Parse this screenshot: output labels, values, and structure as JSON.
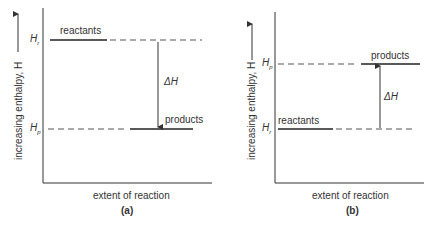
{
  "panels": [
    {
      "id": "a",
      "caption": "(a)",
      "xlabel": "extent of reaction",
      "ylabel": "increasing enthalpy, H",
      "top_level": {
        "symbol": "H",
        "sub": "r",
        "label": "reactants"
      },
      "bottom_level": {
        "symbol": "H",
        "sub": "p",
        "label": "products"
      },
      "delta": "ΔH",
      "arrow_direction": "down"
    },
    {
      "id": "b",
      "caption": "(b)",
      "xlabel": "extent of reaction",
      "ylabel": "increasing enthalpy, H",
      "top_level": {
        "symbol": "H",
        "sub": "p",
        "label": "products"
      },
      "bottom_level": {
        "symbol": "H",
        "sub": "r",
        "label": "reactants"
      },
      "delta": "ΔH",
      "arrow_direction": "up"
    }
  ]
}
